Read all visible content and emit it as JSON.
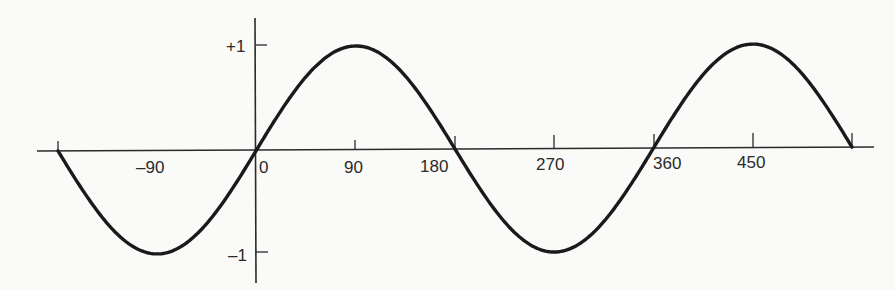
{
  "chart_data": {
    "type": "line",
    "title": "",
    "xlabel": "",
    "ylabel": "",
    "function": "sin(x)",
    "x_units": "degrees",
    "xlim": [
      -180,
      540
    ],
    "ylim": [
      -1,
      1
    ],
    "grid": false,
    "legend": null,
    "x_ticks": [
      -180,
      -90,
      0,
      90,
      180,
      270,
      360,
      450,
      540
    ],
    "x_tick_labels": [
      "",
      "–90",
      "0",
      "90",
      "180",
      "270",
      "360",
      "450",
      ""
    ],
    "y_ticks": [
      1,
      -1
    ],
    "y_tick_labels": [
      "+1",
      "–1"
    ],
    "series": [
      {
        "name": "sine wave",
        "x": [
          -180,
          -135,
          -90,
          -45,
          0,
          45,
          90,
          135,
          180,
          225,
          270,
          315,
          360,
          405,
          450,
          495,
          540
        ],
        "values": [
          0,
          -0.707,
          -1,
          -0.707,
          0,
          0.707,
          1,
          0.707,
          0,
          -0.707,
          -1,
          -0.707,
          0,
          0.707,
          1,
          0.707,
          0
        ]
      }
    ]
  },
  "labels": {
    "x_neg90": "–90",
    "x_0": "0",
    "x_90": "90",
    "x_180": "180",
    "x_270": "270",
    "x_360": "360",
    "x_450": "450",
    "y_pos1": "+1",
    "y_neg1": "–1"
  }
}
